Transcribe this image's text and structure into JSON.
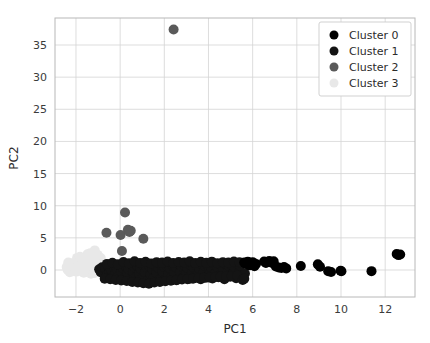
{
  "figure": {
    "background": "#ffffff",
    "grid_color": "#d4d4d4",
    "spine_color": "#b8b8b8",
    "width": 430,
    "height": 343
  },
  "chart_data": {
    "type": "scatter",
    "title": "",
    "xlabel": "PC1",
    "ylabel": "PC2",
    "xlim": [
      -2.95,
      13.35
    ],
    "ylim": [
      -4.2,
      39.2
    ],
    "xticks": [
      -2,
      0,
      2,
      4,
      6,
      8,
      10,
      12
    ],
    "xticklabels": [
      "−2",
      "0",
      "2",
      "4",
      "6",
      "8",
      "10",
      "12"
    ],
    "yticks": [
      0,
      5,
      10,
      15,
      20,
      25,
      30,
      35
    ],
    "yticklabels": [
      "0",
      "5",
      "10",
      "15",
      "20",
      "25",
      "30",
      "35"
    ],
    "grid": true,
    "legend_position": "upper right",
    "marker": "circle",
    "marker_size": 5,
    "series": [
      {
        "name": "Cluster 0",
        "color": "#000000",
        "points": [
          [
            5.62,
            1.15
          ],
          [
            5.7,
            0.95
          ],
          [
            5.78,
            1.3
          ],
          [
            5.85,
            0.72
          ],
          [
            5.92,
            1.05
          ],
          [
            6.0,
            1.22
          ],
          [
            6.08,
            0.6
          ],
          [
            6.15,
            0.95
          ],
          [
            6.52,
            1.32
          ],
          [
            6.6,
            1.1
          ],
          [
            6.75,
            1.4
          ],
          [
            6.88,
            1.08
          ],
          [
            6.95,
            1.35
          ],
          [
            7.05,
            0.55
          ],
          [
            7.18,
            0.38
          ],
          [
            7.3,
            0.3
          ],
          [
            7.42,
            0.45
          ],
          [
            7.52,
            0.25
          ],
          [
            8.18,
            0.62
          ],
          [
            8.95,
            0.88
          ],
          [
            9.05,
            0.5
          ],
          [
            9.42,
            -0.18
          ],
          [
            9.55,
            -0.3
          ],
          [
            9.98,
            -0.12
          ],
          [
            10.02,
            -0.2
          ],
          [
            11.38,
            -0.18
          ],
          [
            12.52,
            2.5
          ],
          [
            12.6,
            2.32
          ],
          [
            12.68,
            2.42
          ]
        ]
      },
      {
        "name": "Cluster 1",
        "color": "#141414",
        "points": [
          [
            -0.95,
            0.1
          ],
          [
            -0.88,
            -0.35
          ],
          [
            -0.82,
            0.42
          ],
          [
            -0.75,
            -0.55
          ],
          [
            -0.68,
            0.25
          ],
          [
            -0.6,
            -0.8
          ],
          [
            -0.55,
            0.6
          ],
          [
            -0.48,
            -0.25
          ],
          [
            -0.42,
            0.05
          ],
          [
            -0.35,
            -1.05
          ],
          [
            -0.28,
            0.48
          ],
          [
            -0.22,
            -0.62
          ],
          [
            -0.15,
            0.18
          ],
          [
            -0.08,
            -0.95
          ],
          [
            0.0,
            0.72
          ],
          [
            0.06,
            -0.32
          ],
          [
            0.12,
            0.3
          ],
          [
            0.18,
            -1.25
          ],
          [
            0.25,
            0.55
          ],
          [
            0.32,
            -0.48
          ],
          [
            0.38,
            0.12
          ],
          [
            0.45,
            -1.55
          ],
          [
            0.52,
            0.85
          ],
          [
            0.58,
            -0.22
          ],
          [
            0.65,
            0.38
          ],
          [
            0.72,
            -1.18
          ],
          [
            0.78,
            0.62
          ],
          [
            0.85,
            -0.58
          ],
          [
            0.92,
            0.22
          ],
          [
            0.98,
            -1.42
          ],
          [
            1.05,
            0.75
          ],
          [
            1.12,
            -0.38
          ],
          [
            1.18,
            0.45
          ],
          [
            1.25,
            -1.62
          ],
          [
            1.32,
            0.58
          ],
          [
            1.38,
            -0.72
          ],
          [
            1.45,
            0.15
          ],
          [
            1.52,
            -1.28
          ],
          [
            1.58,
            0.68
          ],
          [
            1.65,
            -0.42
          ],
          [
            1.72,
            0.35
          ],
          [
            1.78,
            -1.48
          ],
          [
            1.85,
            0.88
          ],
          [
            1.92,
            -0.28
          ],
          [
            1.98,
            0.52
          ],
          [
            2.05,
            -1.35
          ],
          [
            2.12,
            0.62
          ],
          [
            2.18,
            -0.65
          ],
          [
            2.25,
            0.28
          ],
          [
            2.32,
            -1.15
          ],
          [
            2.38,
            0.78
          ],
          [
            2.45,
            -0.45
          ],
          [
            2.52,
            0.42
          ],
          [
            2.58,
            -1.52
          ],
          [
            2.65,
            0.95
          ],
          [
            2.72,
            -0.32
          ],
          [
            2.78,
            0.55
          ],
          [
            2.85,
            -1.22
          ],
          [
            2.92,
            0.68
          ],
          [
            2.98,
            -0.58
          ],
          [
            3.05,
            0.32
          ],
          [
            3.12,
            -1.38
          ],
          [
            3.18,
            0.82
          ],
          [
            3.25,
            -0.48
          ],
          [
            3.32,
            0.45
          ],
          [
            3.38,
            -1.08
          ],
          [
            3.45,
            0.72
          ],
          [
            3.52,
            -0.68
          ],
          [
            3.58,
            0.25
          ],
          [
            3.65,
            -1.45
          ],
          [
            3.72,
            0.88
          ],
          [
            3.78,
            -0.35
          ],
          [
            3.85,
            0.58
          ],
          [
            3.92,
            -1.18
          ],
          [
            3.98,
            0.65
          ],
          [
            4.05,
            -0.55
          ],
          [
            4.12,
            0.38
          ],
          [
            4.18,
            -1.32
          ],
          [
            4.25,
            0.78
          ],
          [
            4.32,
            -0.42
          ],
          [
            4.38,
            0.52
          ],
          [
            4.45,
            -1.12
          ],
          [
            4.52,
            0.85
          ],
          [
            4.58,
            -0.62
          ],
          [
            4.65,
            0.28
          ],
          [
            4.72,
            -1.42
          ],
          [
            4.78,
            0.92
          ],
          [
            4.85,
            -0.38
          ],
          [
            4.92,
            0.62
          ],
          [
            4.98,
            -1.05
          ],
          [
            5.05,
            0.75
          ],
          [
            5.12,
            -0.52
          ],
          [
            5.18,
            0.42
          ],
          [
            5.25,
            -1.28
          ],
          [
            5.32,
            0.95
          ],
          [
            5.38,
            -0.45
          ],
          [
            5.45,
            0.68
          ],
          [
            5.52,
            -0.95
          ],
          [
            5.58,
            1.05
          ],
          [
            5.65,
            -0.55
          ],
          [
            -0.7,
            -1.35
          ],
          [
            -0.45,
            -1.45
          ],
          [
            -0.2,
            -1.55
          ],
          [
            0.05,
            -1.62
          ],
          [
            0.3,
            -1.72
          ],
          [
            0.55,
            -1.85
          ],
          [
            0.8,
            -1.95
          ],
          [
            1.05,
            -2.05
          ],
          [
            1.3,
            -2.12
          ],
          [
            1.55,
            -1.95
          ],
          [
            1.8,
            -1.85
          ],
          [
            2.05,
            -1.75
          ],
          [
            2.3,
            -1.68
          ],
          [
            2.55,
            -1.58
          ],
          [
            2.8,
            -1.48
          ],
          [
            3.05,
            -1.42
          ],
          [
            3.3,
            -1.35
          ],
          [
            3.55,
            -1.28
          ],
          [
            3.8,
            -1.22
          ],
          [
            4.05,
            -1.15
          ],
          [
            4.3,
            -1.1
          ],
          [
            4.55,
            -1.05
          ],
          [
            4.8,
            -1.0
          ],
          [
            5.05,
            -0.95
          ],
          [
            5.3,
            -0.9
          ],
          [
            5.55,
            -1.55
          ],
          [
            5.62,
            -1.35
          ],
          [
            -0.6,
            0.95
          ],
          [
            -0.35,
            1.12
          ],
          [
            -0.1,
            0.88
          ],
          [
            0.15,
            1.25
          ],
          [
            0.4,
            1.05
          ],
          [
            0.65,
            1.35
          ],
          [
            0.9,
            1.08
          ],
          [
            1.15,
            1.28
          ],
          [
            1.4,
            1.02
          ],
          [
            1.65,
            1.22
          ],
          [
            1.9,
            1.15
          ],
          [
            2.15,
            1.32
          ],
          [
            2.4,
            1.1
          ],
          [
            2.65,
            1.25
          ],
          [
            2.9,
            1.18
          ],
          [
            3.15,
            1.35
          ],
          [
            3.4,
            1.08
          ],
          [
            3.65,
            1.28
          ],
          [
            3.9,
            1.12
          ],
          [
            4.15,
            1.3
          ],
          [
            4.4,
            1.05
          ],
          [
            4.65,
            1.22
          ],
          [
            4.9,
            1.15
          ],
          [
            5.15,
            1.32
          ],
          [
            5.4,
            1.2
          ]
        ]
      },
      {
        "name": "Cluster 2",
        "color": "#5a5a5a",
        "points": [
          [
            2.42,
            37.4
          ],
          [
            0.22,
            8.95
          ],
          [
            -0.62,
            5.8
          ],
          [
            0.02,
            5.45
          ],
          [
            0.35,
            6.25
          ],
          [
            0.42,
            5.9
          ],
          [
            0.48,
            6.1
          ],
          [
            1.05,
            4.85
          ],
          [
            0.08,
            2.95
          ]
        ]
      },
      {
        "name": "Cluster 3",
        "color": "#e8e8e8",
        "points": [
          [
            -2.32,
            0.72
          ],
          [
            -2.25,
            0.35
          ],
          [
            -2.18,
            1.05
          ],
          [
            -2.1,
            0.15
          ],
          [
            -2.05,
            0.88
          ],
          [
            -1.98,
            -0.25
          ],
          [
            -1.92,
            0.55
          ],
          [
            -1.85,
            1.2
          ],
          [
            -1.78,
            0.05
          ],
          [
            -1.72,
            0.65
          ],
          [
            -1.65,
            -0.42
          ],
          [
            -1.58,
            0.92
          ],
          [
            -1.52,
            1.45
          ],
          [
            -1.45,
            0.22
          ],
          [
            -1.38,
            0.78
          ],
          [
            -1.32,
            -0.58
          ],
          [
            -1.25,
            1.08
          ],
          [
            -1.18,
            0.38
          ],
          [
            -1.12,
            1.65
          ],
          [
            -1.05,
            -0.12
          ],
          [
            -0.98,
            0.85
          ],
          [
            -0.92,
            0.48
          ],
          [
            -0.85,
            1.25
          ],
          [
            -1.48,
            2.45
          ],
          [
            -1.42,
            2.15
          ],
          [
            -1.35,
            2.62
          ],
          [
            -1.28,
            1.92
          ],
          [
            -1.55,
            1.78
          ],
          [
            -1.62,
            1.35
          ],
          [
            -1.68,
            0.98
          ],
          [
            -2.38,
            0.05
          ],
          [
            -2.28,
            -0.35
          ],
          [
            -2.15,
            -0.18
          ],
          [
            -2.02,
            0.28
          ],
          [
            -1.88,
            -0.08
          ],
          [
            -1.75,
            1.55
          ],
          [
            -1.22,
            0.05
          ],
          [
            -1.08,
            0.62
          ],
          [
            -0.95,
            -0.35
          ],
          [
            -1.15,
            3.05
          ],
          [
            -1.02,
            2.35
          ],
          [
            -0.88,
            1.85
          ],
          [
            -2.42,
            0.45
          ],
          [
            -2.35,
            1.15
          ],
          [
            -1.95,
            1.88
          ],
          [
            -1.82,
            2.05
          ],
          [
            -1.45,
            0.58
          ],
          [
            -1.32,
            0.15
          ],
          [
            -1.18,
            -0.48
          ],
          [
            -1.05,
            1.42
          ],
          [
            -0.92,
            0.95
          ]
        ]
      }
    ]
  }
}
